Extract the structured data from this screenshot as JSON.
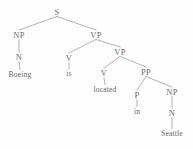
{
  "figure": {
    "kind": "syntax-parse-tree",
    "sentence": "Boeing is located in Seattle",
    "background_color": "#fdfdfd",
    "line_color": "#8a8a8a",
    "text_color": "#4a4a4a"
  },
  "nodes": [
    {
      "id": "s",
      "label": "S",
      "type": "nonterminal",
      "x": 57,
      "y": 12
    },
    {
      "id": "np1",
      "label": "NP",
      "type": "nonterminal",
      "x": 19,
      "y": 35
    },
    {
      "id": "n1",
      "label": "N",
      "type": "nonterminal",
      "x": 19,
      "y": 57
    },
    {
      "id": "boeing",
      "label": "Boeing",
      "type": "terminal",
      "x": 20,
      "y": 75
    },
    {
      "id": "vp1",
      "label": "VP",
      "type": "nonterminal",
      "x": 96,
      "y": 35
    },
    {
      "id": "v1",
      "label": "V",
      "type": "nonterminal",
      "x": 69,
      "y": 58
    },
    {
      "id": "is",
      "label": "is",
      "type": "terminal",
      "x": 69,
      "y": 74
    },
    {
      "id": "vp2",
      "label": "VP",
      "type": "nonterminal",
      "x": 120,
      "y": 52
    },
    {
      "id": "v2",
      "label": "V",
      "type": "nonterminal",
      "x": 104,
      "y": 73
    },
    {
      "id": "located",
      "label": "located",
      "type": "terminal",
      "x": 105,
      "y": 90
    },
    {
      "id": "pp",
      "label": "PP",
      "type": "nonterminal",
      "x": 146,
      "y": 72
    },
    {
      "id": "p",
      "label": "P",
      "type": "nonterminal",
      "x": 137,
      "y": 95
    },
    {
      "id": "in",
      "label": "in",
      "type": "terminal",
      "x": 137,
      "y": 112
    },
    {
      "id": "np2",
      "label": "NP",
      "type": "nonterminal",
      "x": 172,
      "y": 92
    },
    {
      "id": "n2",
      "label": "N",
      "type": "nonterminal",
      "x": 172,
      "y": 113
    },
    {
      "id": "seattle",
      "label": "Seattle",
      "type": "terminal",
      "x": 172,
      "y": 134
    }
  ],
  "edges": [
    {
      "from": "s",
      "to": "np1"
    },
    {
      "from": "s",
      "to": "vp1"
    },
    {
      "from": "np1",
      "to": "n1"
    },
    {
      "from": "n1",
      "to": "boeing"
    },
    {
      "from": "vp1",
      "to": "v1"
    },
    {
      "from": "vp1",
      "to": "vp2"
    },
    {
      "from": "v1",
      "to": "is"
    },
    {
      "from": "vp2",
      "to": "v2"
    },
    {
      "from": "vp2",
      "to": "pp"
    },
    {
      "from": "v2",
      "to": "located"
    },
    {
      "from": "pp",
      "to": "p"
    },
    {
      "from": "pp",
      "to": "np2"
    },
    {
      "from": "p",
      "to": "in"
    },
    {
      "from": "np2",
      "to": "n2"
    },
    {
      "from": "n2",
      "to": "seattle"
    }
  ]
}
